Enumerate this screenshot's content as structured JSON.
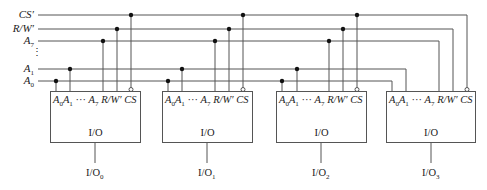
{
  "signals": [
    {
      "name": "cs-line",
      "label": "CS′",
      "y": 15
    },
    {
      "name": "rw-line",
      "label": "R/W′",
      "y": 29
    },
    {
      "name": "a7-line",
      "label": "A7",
      "y": 41
    },
    {
      "name": "a1-line",
      "label": "A1",
      "y": 69
    },
    {
      "name": "a0-line",
      "label": "A0",
      "y": 81
    }
  ],
  "labels": {
    "cs": "CS′",
    "rw": "R/W′",
    "a7_main": "A",
    "a7_sub": "7",
    "a1_main": "A",
    "a1_sub": "1",
    "a0_main": "A",
    "a0_sub": "0",
    "ellipsis": "⋮"
  },
  "chip": {
    "pins_text": {
      "a0": "A",
      "a0_sub": "0",
      "a1": "A",
      "a1_sub": "1",
      "dots": " ··· ",
      "a7": "A",
      "a7_sub": "7",
      "rw": " R/W′ ",
      "cs": "CS"
    },
    "io_label": "I/O"
  },
  "chips": [
    {
      "index": 0,
      "left": 50,
      "output_label": "I/O",
      "output_sub": "0"
    },
    {
      "index": 1,
      "left": 162,
      "output_label": "I/O",
      "output_sub": "1"
    },
    {
      "index": 2,
      "left": 276,
      "output_label": "I/O",
      "output_sub": "2"
    },
    {
      "index": 3,
      "left": 386,
      "output_label": "I/O",
      "output_sub": "3"
    }
  ],
  "colors": {
    "line": "#555555",
    "dot": "#111111",
    "text": "#222222"
  }
}
